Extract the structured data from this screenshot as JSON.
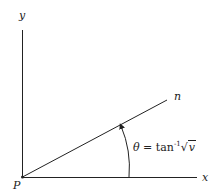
{
  "diagram": {
    "labels": {
      "y_axis": "y",
      "x_axis": "x",
      "origin": "P",
      "line": "n"
    },
    "equation": {
      "symbol": "θ",
      "equals": " = tan",
      "exponent": "-1",
      "radical": "√",
      "radicand": "v"
    },
    "colors": {
      "stroke": "#222222",
      "background": "#ffffff"
    }
  }
}
